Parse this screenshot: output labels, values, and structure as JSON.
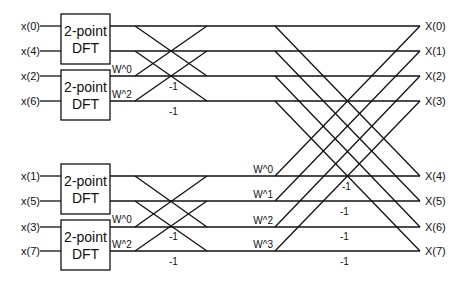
{
  "diagram": {
    "stroke_color": "#111111",
    "inputs": [
      "x(0)",
      "x(4)",
      "x(2)",
      "x(6)",
      "x(1)",
      "x(5)",
      "x(3)",
      "x(7)"
    ],
    "outputs": [
      "X(0)",
      "X(1)",
      "X(2)",
      "X(3)",
      "X(4)",
      "X(5)",
      "X(6)",
      "X(7)"
    ],
    "dft_blocks": [
      {
        "line1": "2-point",
        "line2": "DFT"
      },
      {
        "line1": "2-point",
        "line2": "DFT"
      },
      {
        "line1": "2-point",
        "line2": "DFT"
      },
      {
        "line1": "2-point",
        "line2": "DFT"
      }
    ],
    "stage1": {
      "top_twiddles": [
        "W^0",
        "W^2"
      ],
      "top_minus": [
        "-1",
        "-1"
      ],
      "bottom_twiddles": [
        "W^0",
        "W^2"
      ],
      "bottom_minus": [
        "-1",
        "-1"
      ]
    },
    "stage2": {
      "twiddles": [
        "W^0",
        "W^1",
        "W^2",
        "W^3"
      ],
      "minus": [
        "-1",
        "-1",
        "-1",
        "-1"
      ]
    }
  }
}
